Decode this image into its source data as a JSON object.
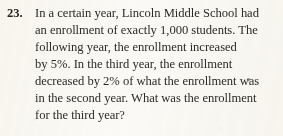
{
  "problem": {
    "number": "23.",
    "lines": [
      "In a certain year, Lincoln Middle School had",
      "an enrollment of exactly 1,000 students. The",
      "following year, the enrollment increased",
      "by 5%. In the third year, the enrollment",
      "decreased by 2% of what the enrollment was",
      "in the second year. What was the enrollment",
      "for the third year?"
    ],
    "full_text": "In a certain year, Lincoln Middle School had an enrollment of exactly 1,000 students. The following year, the enrollment increased by 5%. In the third year, the enrollment decreased by 2% of what the enrollment was in the second year. What was the enrollment for the third year?"
  },
  "colors": {
    "page_background": "#fbfaf7",
    "text": "#2c2b29",
    "number": "#262524"
  }
}
